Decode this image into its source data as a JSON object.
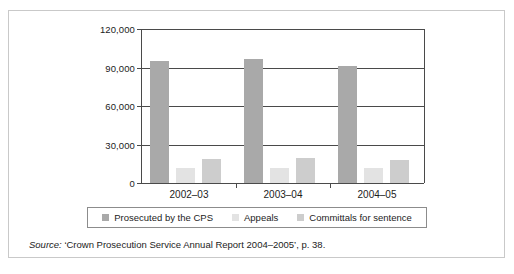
{
  "chart_data": {
    "type": "bar",
    "title": "",
    "xlabel": "",
    "ylabel": "",
    "categories": [
      "2002–03",
      "2003–04",
      "2004–05"
    ],
    "series": [
      {
        "name": "Prosecuted by the CPS",
        "values": [
          95000,
          96500,
          91000
        ],
        "color": "#a9a9a9"
      },
      {
        "name": "Appeals",
        "values": [
          12000,
          11800,
          11500
        ],
        "color": "#e3e3e3"
      },
      {
        "name": "Committals for sentence",
        "values": [
          19000,
          19700,
          18300
        ],
        "color": "#cdcdcd"
      }
    ],
    "ylim": [
      0,
      120000
    ],
    "ytick_values": [
      0,
      30000,
      60000,
      90000,
      120000
    ],
    "ytick_labels": [
      "0",
      "30,000",
      "60,000",
      "90,000",
      "120,000"
    ],
    "grid": true,
    "legend_position": "bottom"
  },
  "legend": {
    "items": [
      {
        "label": "Prosecuted by the CPS"
      },
      {
        "label": "Appeals"
      },
      {
        "label": "Committals for sentence"
      }
    ]
  },
  "source": {
    "label": "Source:",
    "text": " ‘Crown Prosecution Service Annual Report 2004–2005’, p. 38."
  }
}
